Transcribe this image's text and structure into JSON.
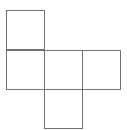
{
  "diagram": {
    "type": "cube-net",
    "line_color": "#707070",
    "squares": [
      {
        "id": "top",
        "x": 6,
        "y": 10,
        "w": 39,
        "h": 40
      },
      {
        "id": "middle-left",
        "x": 6,
        "y": 50,
        "w": 39,
        "h": 40
      },
      {
        "id": "middle-center",
        "x": 44,
        "y": 50,
        "w": 39,
        "h": 40
      },
      {
        "id": "middle-right",
        "x": 82,
        "y": 50,
        "w": 39,
        "h": 40
      },
      {
        "id": "bottom",
        "x": 44,
        "y": 89,
        "w": 39,
        "h": 40
      }
    ]
  }
}
